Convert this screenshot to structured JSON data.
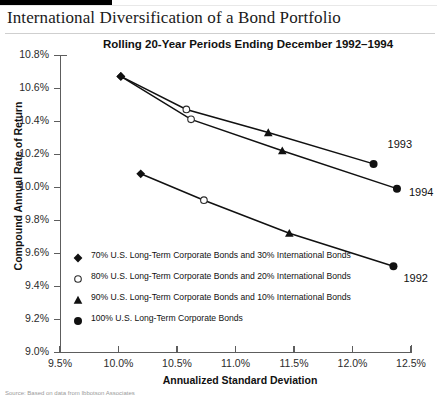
{
  "document": {
    "title": "International Diversification of a Bond Portfolio",
    "footnote": "Source: Based on data from Ibbotson Associates"
  },
  "chart_data": {
    "type": "line",
    "title": "Rolling 20-Year Periods Ending December 1992–1994",
    "xlabel": "Annualized Standard Deviation",
    "ylabel": "Compound Annual Rate of Return",
    "xlim": [
      9.5,
      12.5
    ],
    "ylim": [
      9.0,
      10.8
    ],
    "xticks": [
      "9.5%",
      "10.0%",
      "10.5%",
      "11.0%",
      "11.5%",
      "12.0%",
      "12.5%"
    ],
    "xtick_values": [
      9.5,
      10.0,
      10.5,
      11.0,
      11.5,
      12.0,
      12.5
    ],
    "yticks": [
      "9.0%",
      "9.2%",
      "9.4%",
      "9.6%",
      "9.8%",
      "10.0%",
      "10.2%",
      "10.4%",
      "10.6%",
      "10.8%"
    ],
    "ytick_values": [
      9.0,
      9.2,
      9.4,
      9.6,
      9.8,
      10.0,
      10.2,
      10.4,
      10.6,
      10.8
    ],
    "grid": false,
    "legend_position": "inside-lower-left",
    "markers": [
      "diamond",
      "circle-open",
      "triangle",
      "circle-filled"
    ],
    "series": [
      {
        "name": "1993",
        "label": "1993",
        "points": [
          {
            "x": 10.02,
            "y": 10.67,
            "marker": "diamond",
            "allocation": "70/30"
          },
          {
            "x": 10.58,
            "y": 10.47,
            "marker": "circle-open",
            "allocation": "80/20"
          },
          {
            "x": 11.28,
            "y": 10.33,
            "marker": "triangle",
            "allocation": "90/10"
          },
          {
            "x": 12.18,
            "y": 10.14,
            "marker": "circle-filled",
            "allocation": "100/0"
          }
        ]
      },
      {
        "name": "1994",
        "label": "1994",
        "points": [
          {
            "x": 10.02,
            "y": 10.67,
            "marker": "diamond",
            "allocation": "70/30"
          },
          {
            "x": 10.62,
            "y": 10.41,
            "marker": "circle-open",
            "allocation": "80/20"
          },
          {
            "x": 11.4,
            "y": 10.22,
            "marker": "triangle",
            "allocation": "90/10"
          },
          {
            "x": 12.38,
            "y": 9.99,
            "marker": "circle-filled",
            "allocation": "100/0"
          }
        ]
      },
      {
        "name": "1992",
        "label": "1992",
        "points": [
          {
            "x": 10.19,
            "y": 10.08,
            "marker": "diamond",
            "allocation": "70/30"
          },
          {
            "x": 10.73,
            "y": 9.92,
            "marker": "circle-open",
            "allocation": "80/20"
          },
          {
            "x": 11.46,
            "y": 9.72,
            "marker": "triangle",
            "allocation": "90/10"
          },
          {
            "x": 12.35,
            "y": 9.52,
            "marker": "circle-filled",
            "allocation": "100/0"
          }
        ]
      }
    ],
    "legend": [
      {
        "marker": "diamond",
        "text": "70% U.S. Long-Term Corporate Bonds and 30% International Bonds"
      },
      {
        "marker": "circle-open",
        "text": "80% U.S. Long-Term Corporate Bonds and 20% International Bonds"
      },
      {
        "marker": "triangle",
        "text": "90% U.S. Long-Term Corporate Bonds and 10% International Bonds"
      },
      {
        "marker": "circle-filled",
        "text": "100% U.S. Long-Term Corporate Bonds"
      }
    ],
    "colors": {
      "line": "#111111",
      "marker": "#111111",
      "axis": "#5d5d5d",
      "background": "#ffffff"
    }
  }
}
